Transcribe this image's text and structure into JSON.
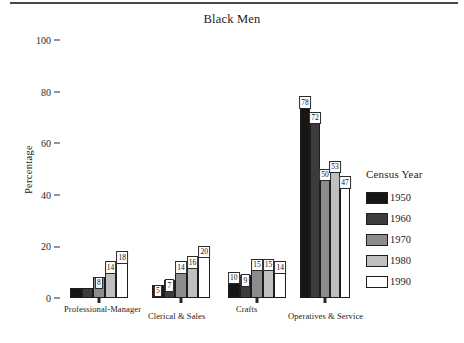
{
  "header": {
    "rule": "horizontal-rule"
  },
  "chart_data": {
    "type": "bar",
    "title": "Black Men",
    "xlabel": "",
    "ylabel": "Percentage",
    "ylim": [
      0,
      100
    ],
    "yticks": [
      0,
      20,
      40,
      60,
      80,
      100
    ],
    "ytick_labels": [
      "0",
      "20",
      "40",
      "60",
      "80",
      "100"
    ],
    "grid": false,
    "legend_position": "right",
    "legend_title": "Census Year",
    "categories": [
      "Professional-Manager",
      "Clerical & Sales",
      "Crafts",
      "Operatives & Service"
    ],
    "series": [
      {
        "name": "1950",
        "color": "#161616",
        "values": [
          4,
          5,
          10,
          78
        ],
        "labels": [
          "",
          "5",
          "10",
          "78"
        ]
      },
      {
        "name": "1960",
        "color": "#3d3c3c",
        "values": [
          4,
          7,
          9,
          72
        ],
        "labels": [
          "",
          "7",
          "9",
          "72"
        ]
      },
      {
        "name": "1970",
        "color": "#8c8c8c",
        "values": [
          8,
          14,
          15,
          50
        ],
        "labels": [
          "8",
          "14",
          "15",
          "50"
        ]
      },
      {
        "name": "1980",
        "color": "#bfbfbf",
        "values": [
          14,
          16,
          15,
          53
        ],
        "labels": [
          "14",
          "16",
          "15",
          "53"
        ]
      },
      {
        "name": "1990",
        "color": "#ffffff",
        "values": [
          18,
          20,
          14,
          47
        ],
        "labels": [
          "18",
          "20",
          "14",
          "47"
        ]
      }
    ]
  }
}
